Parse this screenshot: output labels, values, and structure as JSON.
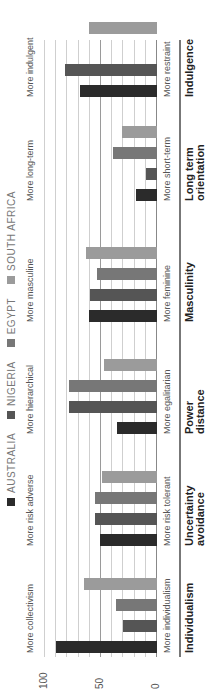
{
  "chart_data": {
    "type": "bar",
    "orientation": "rotated-90-ccw",
    "title": "",
    "xlabel": "",
    "ylabel": "",
    "ylim": [
      0,
      100
    ],
    "yticks": [
      "0",
      "50",
      "100"
    ],
    "grid": true,
    "legend_position": "top",
    "categories": [
      "Individualism",
      "Uncertainty avoidance",
      "Power distance",
      "Masculinity",
      "Long term orientation",
      "Indulgence"
    ],
    "low_labels": [
      "More individualism",
      "More risk tolerant",
      "More egalitarian",
      "More feminine",
      "More short-term",
      "More restraint"
    ],
    "high_labels": [
      "More collectivism",
      "More risk adverse",
      "More hierarchical",
      "More masculine",
      "More long-term",
      "More indulgent"
    ],
    "series": [
      {
        "name": "AUSTRALIA",
        "color": "#2b2b2b",
        "values": [
          90,
          51,
          36,
          61,
          19,
          69
        ]
      },
      {
        "name": "NIGERIA",
        "color": "#555555",
        "values": [
          30,
          55,
          79,
          60,
          10,
          82
        ]
      },
      {
        "name": "EGYPT",
        "color": "#777777",
        "values": [
          37,
          55,
          79,
          54,
          39,
          0
        ]
      },
      {
        "name": "SOUTH AFRICA",
        "color": "#9b9b9b",
        "values": [
          65,
          49,
          47,
          63,
          31,
          61
        ]
      }
    ]
  }
}
